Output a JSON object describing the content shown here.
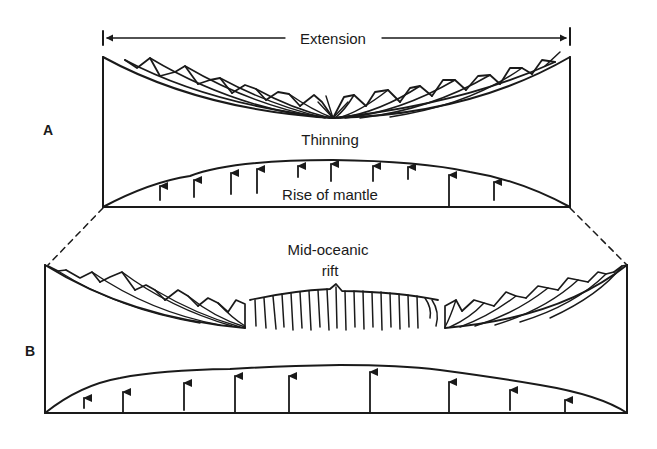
{
  "figure": {
    "extension_label": "Extension",
    "panel_a": {
      "label": "A",
      "thinning_label": "Thinning",
      "mantle_label": "Rise of mantle"
    },
    "panel_b": {
      "label": "B",
      "rift_label_line1": "Mid-oceanic",
      "rift_label_line2": "rift"
    },
    "colors": {
      "ink": "#1a1a1a",
      "background": "#ffffff"
    }
  }
}
